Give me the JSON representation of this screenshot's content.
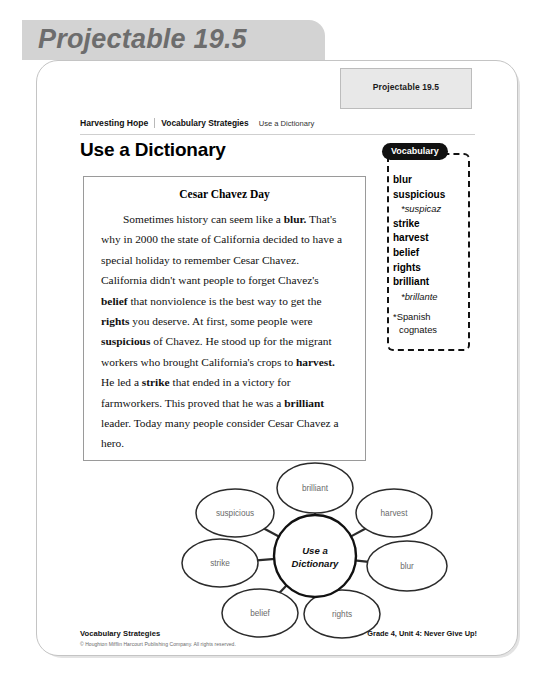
{
  "banner": {
    "title": "Projectable 19.5"
  },
  "tab": {
    "label": "Projectable 19.5"
  },
  "breadcrumb": {
    "item1": "Harvesting Hope",
    "item2": "Vocabulary Strategies",
    "item3": "Use a Dictionary"
  },
  "heading": "Use a Dictionary",
  "passage": {
    "title": "Cesar Chavez Day",
    "segments": [
      {
        "text": "Sometimes history can seem like a ",
        "bold": false
      },
      {
        "text": "blur.",
        "bold": true
      },
      {
        "text": " That's why in 2000 the state of California decided to have a special holiday to remember Cesar Chavez. California didn't want people to forget Chavez's ",
        "bold": false
      },
      {
        "text": "belief",
        "bold": true
      },
      {
        "text": " that nonviolence is the best way to get the ",
        "bold": false
      },
      {
        "text": "rights",
        "bold": true
      },
      {
        "text": " you deserve. At first, some people were ",
        "bold": false
      },
      {
        "text": "suspicious",
        "bold": true
      },
      {
        "text": " of Chavez. He stood up for the migrant workers who brought California's crops to ",
        "bold": false
      },
      {
        "text": "harvest.",
        "bold": true
      },
      {
        "text": " He led a ",
        "bold": false
      },
      {
        "text": "strike",
        "bold": true
      },
      {
        "text": " that ended in a victory for farmworkers. This proved that he was a ",
        "bold": false
      },
      {
        "text": "brilliant",
        "bold": true
      },
      {
        "text": " leader. Today many people consider Cesar Chavez a hero.",
        "bold": false
      }
    ]
  },
  "vocabulary": {
    "pill_label": "Vocabulary",
    "entries": [
      {
        "word": "blur",
        "cognate": null
      },
      {
        "word": "suspicious",
        "cognate": "*suspicaz"
      },
      {
        "word": "strike",
        "cognate": null
      },
      {
        "word": "harvest",
        "cognate": null
      },
      {
        "word": "belief",
        "cognate": null
      },
      {
        "word": "rights",
        "cognate": null
      },
      {
        "word": "brilliant",
        "cognate": "*brillante"
      }
    ],
    "note_line1": "*Spanish",
    "note_line2": "cognates"
  },
  "word_web": {
    "center": {
      "line1": "Use a",
      "line2": "Dictionary"
    },
    "nodes": [
      {
        "label": "brilliant",
        "cx": 158,
        "cy": 32,
        "rx": 38,
        "ry": 25
      },
      {
        "label": "suspicious",
        "cx": 78,
        "cy": 57,
        "rx": 39,
        "ry": 24
      },
      {
        "label": "harvest",
        "cx": 237,
        "cy": 57,
        "rx": 38,
        "ry": 24
      },
      {
        "label": "strike",
        "cx": 63,
        "cy": 107,
        "rx": 38,
        "ry": 24
      },
      {
        "label": "blur",
        "cx": 250,
        "cy": 110,
        "rx": 40,
        "ry": 25
      },
      {
        "label": "belief",
        "cx": 103,
        "cy": 157,
        "rx": 38,
        "ry": 24
      },
      {
        "label": "rights",
        "cx": 185,
        "cy": 158,
        "rx": 38,
        "ry": 24
      }
    ],
    "center_node": {
      "cx": 158,
      "cy": 100,
      "r": 41
    }
  },
  "footer": {
    "title": "Vocabulary Strategies",
    "copyright": "© Houghton Mifflin Harcourt Publishing Company. All rights reserved.",
    "right": "Grade 4, Unit 4: Never Give Up!"
  }
}
